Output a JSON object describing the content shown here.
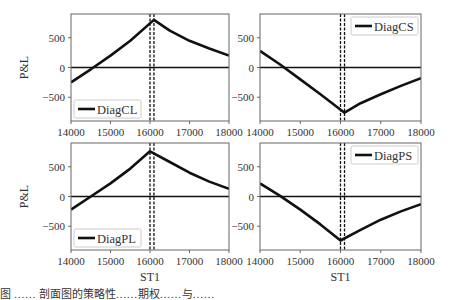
{
  "chart_data": [
    {
      "type": "line",
      "panel": "top-left",
      "legend": [
        "DiagCL"
      ],
      "legend_position": "lower left",
      "xlabel": "",
      "ylabel": "P&L",
      "xlim": [
        14000,
        18000
      ],
      "ylim": [
        -900,
        900
      ],
      "xticks": [
        "14000",
        "15000",
        "16000",
        "17000",
        "18000"
      ],
      "yticks": [
        "-500",
        "0",
        "500"
      ],
      "vlines": [
        16000,
        16100
      ],
      "hline": 0,
      "series": [
        {
          "name": "DiagCL",
          "x": [
            14000,
            14500,
            15000,
            15500,
            16100,
            16500,
            17000,
            17500,
            18000
          ],
          "y": [
            -250,
            -30,
            200,
            450,
            800,
            620,
            450,
            320,
            200
          ]
        }
      ]
    },
    {
      "type": "line",
      "panel": "top-right",
      "legend": [
        "DiagCS"
      ],
      "legend_position": "upper right",
      "xlabel": "",
      "ylabel": "",
      "xlim": [
        14000,
        18000
      ],
      "ylim": [
        -900,
        900
      ],
      "xticks": [
        "14000",
        "15000",
        "16000",
        "17000",
        "18000"
      ],
      "yticks": [
        "-500",
        "0",
        "500"
      ],
      "vlines": [
        16000,
        16100
      ],
      "hline": 0,
      "series": [
        {
          "name": "DiagCS",
          "x": [
            14000,
            14500,
            15000,
            15500,
            16100,
            16500,
            17000,
            17500,
            18000
          ],
          "y": [
            280,
            50,
            -200,
            -450,
            -760,
            -600,
            -450,
            -310,
            -180
          ]
        }
      ]
    },
    {
      "type": "line",
      "panel": "bottom-left",
      "legend": [
        "DiagPL"
      ],
      "legend_position": "lower left",
      "xlabel": "ST1",
      "ylabel": "P&L",
      "xlim": [
        14000,
        18000
      ],
      "ylim": [
        -900,
        900
      ],
      "xticks": [
        "14000",
        "15000",
        "16000",
        "17000",
        "18000"
      ],
      "yticks": [
        "-500",
        "0",
        "500"
      ],
      "vlines": [
        16000,
        16100
      ],
      "hline": 0,
      "series": [
        {
          "name": "DiagPL",
          "x": [
            14000,
            14500,
            15000,
            15500,
            16000,
            16500,
            17000,
            17500,
            18000
          ],
          "y": [
            -220,
            0,
            220,
            470,
            760,
            580,
            400,
            250,
            130
          ]
        }
      ]
    },
    {
      "type": "line",
      "panel": "bottom-right",
      "legend": [
        "DiagPS"
      ],
      "legend_position": "upper right",
      "xlabel": "ST1",
      "ylabel": "",
      "xlim": [
        14000,
        18000
      ],
      "ylim": [
        -900,
        900
      ],
      "xticks": [
        "14000",
        "15000",
        "16000",
        "17000",
        "18000"
      ],
      "yticks": [
        "-500",
        "0",
        "500"
      ],
      "vlines": [
        16000,
        16100
      ],
      "hline": 0,
      "series": [
        {
          "name": "DiagPS",
          "x": [
            14000,
            14500,
            15000,
            15500,
            16000,
            16500,
            17000,
            17500,
            18000
          ],
          "y": [
            220,
            10,
            -220,
            -470,
            -740,
            -560,
            -390,
            -250,
            -130
          ]
        }
      ]
    }
  ],
  "caption": {
    "text": "图 …… 剖面图的策略性……期权……与……"
  }
}
